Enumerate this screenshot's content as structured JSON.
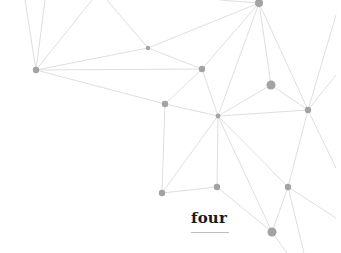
{
  "caption": {
    "text": "four"
  },
  "style": {
    "line_color": "#d6d6d6",
    "node_color": "#a3a3a3",
    "background": "#ffffff",
    "text_color": "#1a1a1a"
  },
  "network": {
    "nodes": [
      {
        "id": "n1",
        "x": 36,
        "y": 70,
        "r": 3.2
      },
      {
        "id": "n2",
        "x": 148,
        "y": 48,
        "r": 2.2
      },
      {
        "id": "n3",
        "x": 202,
        "y": 69,
        "r": 3.2
      },
      {
        "id": "n4",
        "x": 259,
        "y": 3,
        "r": 4
      },
      {
        "id": "n5",
        "x": 165,
        "y": 104,
        "r": 3.2
      },
      {
        "id": "n6",
        "x": 218,
        "y": 116,
        "r": 2.4
      },
      {
        "id": "n7",
        "x": 271,
        "y": 85,
        "r": 4.5
      },
      {
        "id": "n8",
        "x": 308,
        "y": 110,
        "r": 3.2
      },
      {
        "id": "n9",
        "x": 162,
        "y": 193,
        "r": 3.2
      },
      {
        "id": "n10",
        "x": 217,
        "y": 187,
        "r": 3.2
      },
      {
        "id": "n11",
        "x": 288,
        "y": 187,
        "r": 3.2
      },
      {
        "id": "n12",
        "x": 272,
        "y": 232,
        "r": 4.5
      }
    ],
    "edges": [
      [
        36,
        70,
        25,
        0
      ],
      [
        36,
        70,
        45,
        0
      ],
      [
        36,
        70,
        92,
        0
      ],
      [
        36,
        70,
        148,
        48
      ],
      [
        36,
        70,
        202,
        69
      ],
      [
        36,
        70,
        165,
        104
      ],
      [
        107,
        0,
        148,
        48
      ],
      [
        148,
        48,
        259,
        3
      ],
      [
        148,
        48,
        202,
        69
      ],
      [
        259,
        3,
        220,
        0
      ],
      [
        259,
        3,
        202,
        69
      ],
      [
        259,
        3,
        218,
        116
      ],
      [
        259,
        3,
        271,
        85
      ],
      [
        259,
        3,
        308,
        110
      ],
      [
        202,
        69,
        165,
        104
      ],
      [
        202,
        69,
        218,
        116
      ],
      [
        165,
        104,
        218,
        116
      ],
      [
        165,
        104,
        162,
        193
      ],
      [
        218,
        116,
        271,
        85
      ],
      [
        218,
        116,
        308,
        110
      ],
      [
        218,
        116,
        162,
        193
      ],
      [
        218,
        116,
        217,
        187
      ],
      [
        218,
        116,
        272,
        232
      ],
      [
        218,
        116,
        288,
        187
      ],
      [
        271,
        85,
        308,
        110
      ],
      [
        308,
        110,
        336,
        15
      ],
      [
        308,
        110,
        336,
        75
      ],
      [
        308,
        110,
        336,
        168
      ],
      [
        308,
        110,
        288,
        187
      ],
      [
        162,
        193,
        217,
        187
      ],
      [
        217,
        187,
        272,
        232
      ],
      [
        288,
        187,
        272,
        232
      ],
      [
        288,
        187,
        336,
        218
      ],
      [
        288,
        187,
        304,
        253
      ],
      [
        272,
        232,
        287,
        253
      ]
    ]
  }
}
